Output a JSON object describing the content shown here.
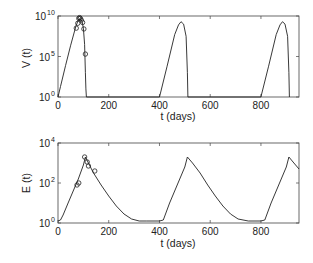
{
  "chart_data": [
    {
      "type": "line",
      "title": "",
      "xlabel": "t (days)",
      "ylabel": "V (t)",
      "yscale": "log",
      "xlim": [
        0,
        950
      ],
      "ylim_exponents": [
        0,
        10
      ],
      "xticks": [
        "0",
        "200",
        "400",
        "600",
        "800"
      ],
      "yticks": [
        {
          "base": "10",
          "exp": "0"
        },
        {
          "base": "10",
          "exp": "5"
        },
        {
          "base": "10",
          "exp": "10"
        }
      ],
      "grid": false,
      "series": [
        {
          "name": "model",
          "style": "line",
          "x": [
            0,
            10,
            30,
            50,
            70,
            80,
            88,
            95,
            100,
            105,
            108,
            110,
            112,
            400,
            430,
            460,
            475,
            485,
            495,
            505,
            510,
            512,
            800,
            830,
            860,
            875,
            885,
            895,
            905,
            910,
            912
          ],
          "log10_y": [
            0,
            1.3,
            3.9,
            6.4,
            8.7,
            9.5,
            9.6,
            9.3,
            8.5,
            6.5,
            3,
            1,
            0,
            0,
            3.8,
            7.7,
            8.9,
            9.3,
            9.0,
            7.5,
            3,
            0,
            0,
            3.8,
            7.7,
            8.9,
            9.3,
            9.0,
            7.5,
            3,
            0
          ]
        },
        {
          "name": "data",
          "style": "markers-open-circle",
          "x": [
            72,
            78,
            82,
            85,
            88,
            92,
            97,
            102,
            108
          ],
          "log10_y": [
            8.5,
            9.1,
            9.7,
            9.8,
            9.7,
            9.5,
            9.2,
            8.4,
            5.3
          ]
        }
      ]
    },
    {
      "type": "line",
      "title": "",
      "xlabel": "t (days)",
      "ylabel": "E (t)",
      "yscale": "log",
      "xlim": [
        0,
        950
      ],
      "ylim_exponents": [
        0,
        4
      ],
      "xticks": [
        "0",
        "200",
        "400",
        "600",
        "800"
      ],
      "yticks": [
        {
          "base": "10",
          "exp": "0"
        },
        {
          "base": "10",
          "exp": "2"
        },
        {
          "base": "10",
          "exp": "4"
        }
      ],
      "grid": false,
      "series": [
        {
          "name": "model",
          "style": "line",
          "x": [
            0,
            10,
            20,
            40,
            60,
            80,
            100,
            108,
            120,
            140,
            170,
            200,
            230,
            260,
            290,
            320,
            350,
            400,
            415,
            440,
            470,
            500,
            510,
            530,
            560,
            590,
            620,
            650,
            680,
            710,
            750,
            800,
            815,
            840,
            870,
            900,
            910,
            930,
            950
          ],
          "log10_y": [
            0.1,
            0.15,
            0.4,
            1.0,
            1.6,
            2.2,
            2.9,
            3.3,
            3.0,
            2.5,
            1.9,
            1.35,
            0.85,
            0.45,
            0.2,
            0.1,
            0.1,
            0.1,
            0.15,
            1.0,
            1.9,
            2.8,
            3.3,
            3.0,
            2.5,
            1.9,
            1.35,
            0.85,
            0.45,
            0.2,
            0.1,
            0.1,
            0.15,
            1.0,
            1.9,
            2.8,
            3.3,
            3.0,
            2.7
          ]
        },
        {
          "name": "data",
          "style": "markers-open-circle",
          "x": [
            75,
            82,
            105,
            115,
            120,
            145
          ],
          "log10_y": [
            1.9,
            2.0,
            3.3,
            3.05,
            2.85,
            2.6
          ]
        }
      ]
    }
  ],
  "plots": {
    "top": {
      "ylabel": "V (t)",
      "xlabel": "t (days)",
      "xticks": [
        "0",
        "200",
        "400",
        "600",
        "800"
      ],
      "ytick_base": "10",
      "ytick_exps": [
        "0",
        "5",
        "10"
      ]
    },
    "bottom": {
      "ylabel": "E (t)",
      "xlabel": "t (days)",
      "xticks": [
        "0",
        "200",
        "400",
        "600",
        "800"
      ],
      "ytick_base": "10",
      "ytick_exps": [
        "0",
        "2",
        "4"
      ]
    }
  }
}
